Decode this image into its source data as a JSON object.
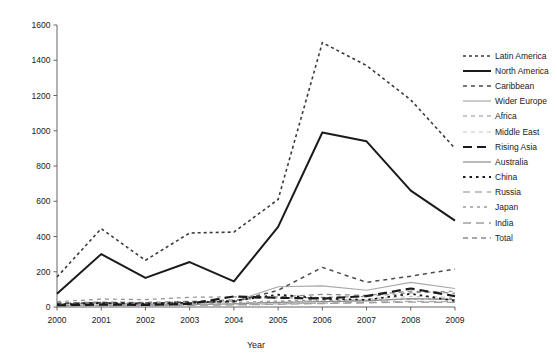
{
  "chart_data": {
    "type": "line",
    "title": "",
    "xlabel": "Year",
    "ylabel": "",
    "categories": [
      2000,
      2001,
      2002,
      2003,
      2004,
      2005,
      2006,
      2007,
      2008,
      2009
    ],
    "x": [
      2000,
      2001,
      2002,
      2003,
      2004,
      2005,
      2006,
      2007,
      2008,
      2009
    ],
    "xlim": [
      2000,
      2009
    ],
    "ylim": [
      0,
      1600
    ],
    "ytick_values": [
      0,
      200,
      400,
      600,
      800,
      1000,
      1200,
      1400,
      1600
    ],
    "ytick_labels": [
      "0",
      "200",
      "400",
      "600",
      "800",
      "1000",
      "1200",
      "1400",
      "1600"
    ],
    "xtick_labels": [
      "2000",
      "2001",
      "2002",
      "2003",
      "2004",
      "2005",
      "2006",
      "2007",
      "2008",
      "2009"
    ],
    "grid": false,
    "legend_position": "right",
    "series": [
      {
        "name": "Latin America",
        "color": "#3a3a3a",
        "style": "dotted",
        "width": 1.6,
        "dash": "3,3",
        "values": [
          170,
          445,
          265,
          420,
          425,
          610,
          1500,
          1370,
          1175,
          900
        ]
      },
      {
        "name": "North America",
        "color": "#1a1a1a",
        "style": "solid",
        "width": 2.0,
        "dash": "",
        "values": [
          75,
          300,
          165,
          255,
          145,
          455,
          990,
          940,
          660,
          490
        ]
      },
      {
        "name": "Caribbean",
        "color": "#4a4a4a",
        "style": "dashed",
        "width": 1.5,
        "dash": "4,4",
        "values": [
          20,
          25,
          22,
          28,
          30,
          95,
          225,
          140,
          175,
          215
        ]
      },
      {
        "name": "Wider Europe",
        "color": "#a8a8a8",
        "style": "solid",
        "width": 1.2,
        "dash": "",
        "values": [
          18,
          22,
          20,
          25,
          30,
          115,
          120,
          95,
          140,
          105
        ]
      },
      {
        "name": "Africa",
        "color": "#909090",
        "style": "dashed",
        "width": 1.2,
        "dash": "4,4",
        "values": [
          30,
          45,
          42,
          55,
          58,
          50,
          55,
          60,
          80,
          90
        ]
      },
      {
        "name": "Middle East",
        "color": "#c4c4c4",
        "style": "dashed",
        "width": 1.2,
        "dash": "4,4",
        "values": [
          12,
          18,
          16,
          20,
          22,
          30,
          35,
          45,
          60,
          55
        ]
      },
      {
        "name": "Rising Asia",
        "color": "#1a1a1a",
        "style": "dashed",
        "width": 2.2,
        "dash": "9,5",
        "values": [
          10,
          14,
          12,
          18,
          60,
          52,
          48,
          62,
          105,
          62
        ]
      },
      {
        "name": "Australia",
        "color": "#8c8c8c",
        "style": "solid",
        "width": 1.2,
        "dash": "",
        "values": [
          8,
          10,
          12,
          14,
          18,
          26,
          30,
          35,
          48,
          42
        ]
      },
      {
        "name": "China",
        "color": "#1a1a1a",
        "style": "dotted",
        "width": 1.8,
        "dash": "2.5,4",
        "values": [
          14,
          22,
          18,
          24,
          35,
          70,
          48,
          40,
          75,
          35
        ]
      },
      {
        "name": "Russia",
        "color": "#b0b0b0",
        "style": "dashed",
        "width": 1.4,
        "dash": "7,5",
        "values": [
          6,
          8,
          9,
          11,
          14,
          18,
          22,
          26,
          32,
          30
        ]
      },
      {
        "name": "Japan",
        "color": "#9a9a9a",
        "style": "dotted",
        "width": 1.3,
        "dash": "3,4",
        "values": [
          16,
          20,
          24,
          22,
          26,
          34,
          40,
          38,
          44,
          48
        ]
      },
      {
        "name": "India",
        "color": "#a0a0a0",
        "style": "dashed",
        "width": 1.4,
        "dash": "8,5",
        "values": [
          5,
          7,
          8,
          10,
          12,
          16,
          20,
          24,
          28,
          26
        ]
      },
      {
        "name": "Total",
        "color": "#8a8a8a",
        "style": "dashed",
        "width": 1.3,
        "dash": "5,4",
        "values": [
          22,
          28,
          26,
          32,
          40,
          58,
          72,
          66,
          90,
          78
        ]
      }
    ]
  },
  "axes": {
    "xlabel": "Year"
  },
  "legend": {
    "items": [
      {
        "label": "Latin America"
      },
      {
        "label": "North America"
      },
      {
        "label": "Caribbean"
      },
      {
        "label": "Wider Europe"
      },
      {
        "label": "Africa"
      },
      {
        "label": "Middle East"
      },
      {
        "label": "Rising Asia"
      },
      {
        "label": "Australia"
      },
      {
        "label": "China"
      },
      {
        "label": "Russia"
      },
      {
        "label": "Japan"
      },
      {
        "label": "India"
      },
      {
        "label": "Total"
      }
    ]
  }
}
